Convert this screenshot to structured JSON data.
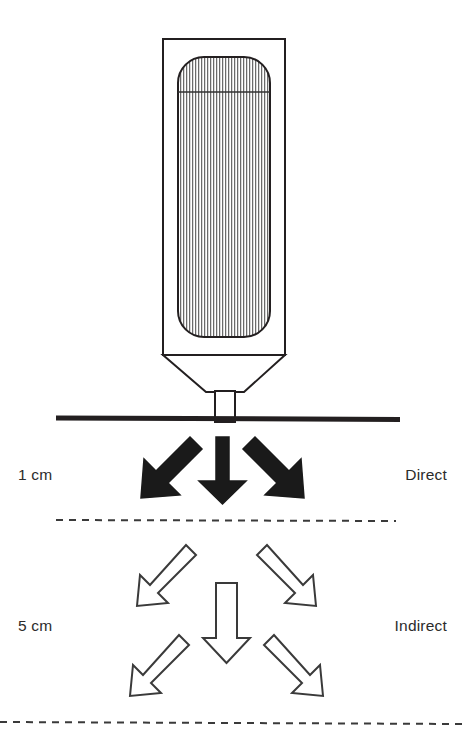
{
  "figure": {
    "background_color": "#ffffff",
    "line_color": "#231f20",
    "fill_solid_color": "#1a1a1a",
    "hatch_color": "#555555"
  },
  "device": {
    "name": "probe-housing",
    "outer_box": {
      "x": 163,
      "y": 39,
      "width": 122,
      "height": 316
    },
    "inner_element": {
      "x": 178,
      "y": 57,
      "width": 92,
      "height": 280,
      "radius": 26
    },
    "inner_divider_y": 92,
    "funnel": {
      "top_left_x": 163,
      "top_right_x": 285,
      "top_y": 355,
      "bottom_left_x": 206,
      "bottom_right_x": 244,
      "bottom_y": 392
    },
    "nozzle": {
      "x": 215,
      "y": 392,
      "width": 20,
      "height": 30
    }
  },
  "surface_line": {
    "name": "contact-surface",
    "x1": 56,
    "x2": 400,
    "y": 418,
    "thickness": 5,
    "style": "solid"
  },
  "divider_lines": [
    {
      "name": "divider-direct-indirect",
      "x1": 56,
      "x2": 396,
      "y": 520,
      "style": "dashed"
    },
    {
      "name": "divider-bottom",
      "x1": 0,
      "x2": 465,
      "y": 723,
      "style": "dashed"
    }
  ],
  "zones": [
    {
      "id": "direct",
      "distance_label": "1 cm",
      "mode_label": "Direct",
      "arrow_style": "filled",
      "arrow_count": 3,
      "label_y": 474
    },
    {
      "id": "indirect",
      "distance_label": "5 cm",
      "mode_label": "Indirect",
      "arrow_style": "outline",
      "arrow_count": 5,
      "label_y": 625
    }
  ],
  "arrows": {
    "direct": [
      {
        "name": "arrow-direct-down-left",
        "direction": "down-left"
      },
      {
        "name": "arrow-direct-down",
        "direction": "down"
      },
      {
        "name": "arrow-direct-down-right",
        "direction": "down-right"
      }
    ],
    "indirect": [
      {
        "name": "arrow-indirect-upper-left",
        "direction": "down-left"
      },
      {
        "name": "arrow-indirect-center",
        "direction": "down"
      },
      {
        "name": "arrow-indirect-upper-right",
        "direction": "down-right"
      },
      {
        "name": "arrow-indirect-lower-left",
        "direction": "down-left"
      },
      {
        "name": "arrow-indirect-lower-right",
        "direction": "down-right"
      }
    ]
  }
}
